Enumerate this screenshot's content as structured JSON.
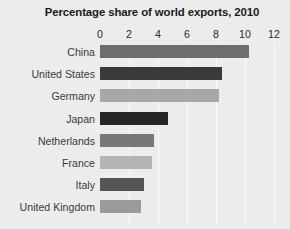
{
  "chart_data": {
    "type": "bar",
    "orientation": "horizontal",
    "title": "Percentage share of world exports, 2010",
    "xlabel": "",
    "ylabel": "",
    "xlim": [
      0,
      12
    ],
    "xticks": [
      0,
      2,
      4,
      6,
      8,
      10,
      12
    ],
    "xtick_labels": [
      "0",
      "2",
      "4",
      "6",
      "8",
      "10",
      "12"
    ],
    "grid": true,
    "grid_axis": "x",
    "grid_color": "#fbfbfb",
    "legend": false,
    "background_color": "#ececed",
    "categories": [
      "China",
      "United States",
      "Germany",
      "Japan",
      "Netherlands",
      "France",
      "Italy",
      "United Kingdom"
    ],
    "values": [
      10.3,
      8.4,
      8.2,
      4.7,
      3.7,
      3.6,
      3.0,
      2.8
    ],
    "bar_colors": [
      "#6d6d6d",
      "#3a3a3a",
      "#a8a8a8",
      "#262626",
      "#787878",
      "#b4b4b4",
      "#555555",
      "#9a9a9a"
    ]
  }
}
